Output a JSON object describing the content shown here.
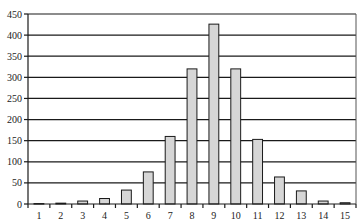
{
  "chart_data": {
    "type": "bar",
    "title": "",
    "xlabel": "",
    "ylabel": "",
    "categories": [
      "1",
      "2",
      "3",
      "4",
      "5",
      "6",
      "7",
      "8",
      "9",
      "10",
      "11",
      "12",
      "13",
      "14",
      "15"
    ],
    "values": [
      1,
      2,
      7,
      13,
      33,
      76,
      160,
      320,
      426,
      320,
      153,
      64,
      31,
      7,
      3
    ],
    "ylim": [
      0,
      450
    ],
    "yticks": [
      0,
      50,
      100,
      150,
      200,
      250,
      300,
      350,
      400,
      450
    ],
    "grid": true,
    "legend": "none",
    "colors": {
      "bar_fill": "#d6d6d6",
      "bar_stroke": "#1a1a1a",
      "grid": "#1a1a1a"
    }
  }
}
